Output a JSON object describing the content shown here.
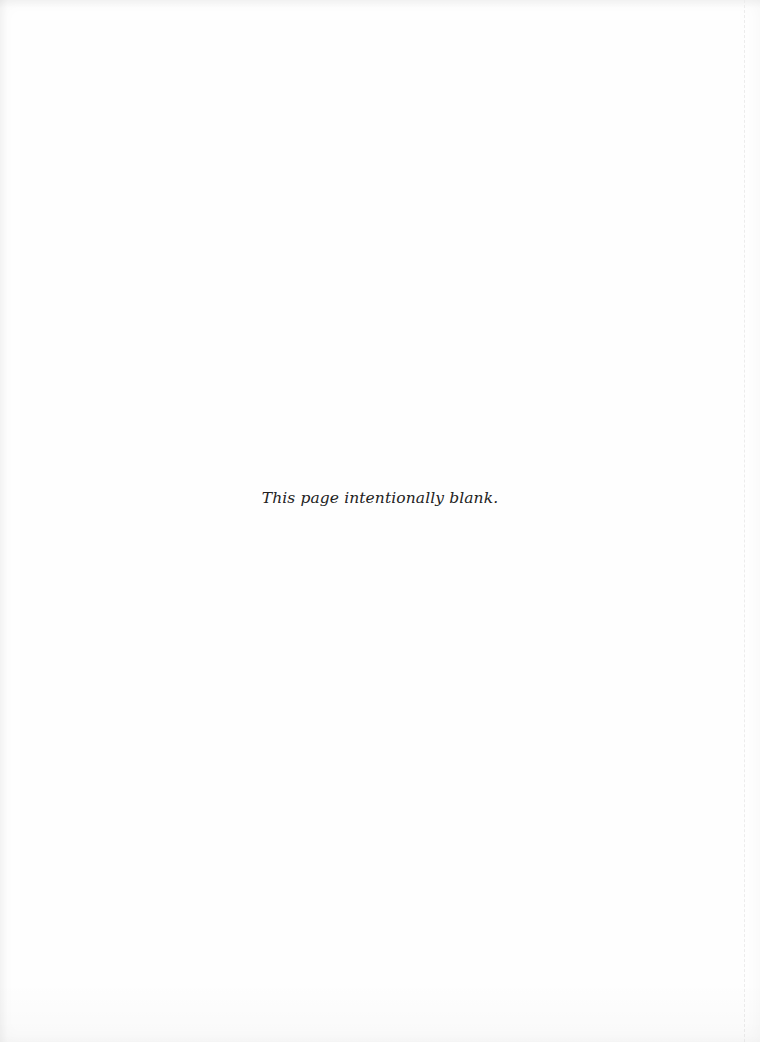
{
  "page": {
    "note": "This page intentionally blank.",
    "colors": {
      "paper": "#fefefe",
      "text": "#222222",
      "scan_edge": "#ececec"
    }
  }
}
